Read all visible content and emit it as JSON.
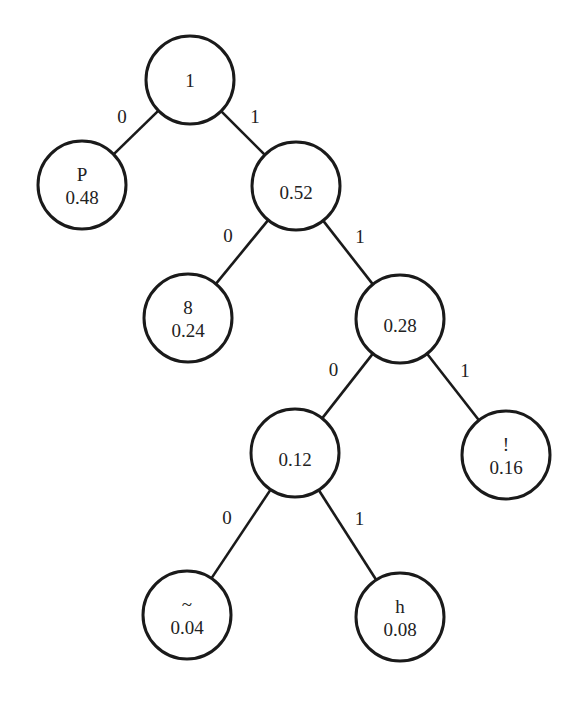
{
  "diagram": {
    "type": "huffman-tree",
    "nodes": [
      {
        "id": "root",
        "symbol": "",
        "prob": "1",
        "cx": 190,
        "cy": 80
      },
      {
        "id": "P",
        "symbol": "P",
        "prob": "0.48",
        "cx": 82,
        "cy": 185
      },
      {
        "id": "n052",
        "symbol": "",
        "prob": "0.52",
        "cx": 296,
        "cy": 186
      },
      {
        "id": "n8",
        "symbol": "8",
        "prob": "0.24",
        "cx": 188,
        "cy": 318
      },
      {
        "id": "n028",
        "symbol": "",
        "prob": "0.28",
        "cx": 400,
        "cy": 319
      },
      {
        "id": "n012",
        "symbol": "",
        "prob": "0.12",
        "cx": 295,
        "cy": 453
      },
      {
        "id": "bang",
        "symbol": "!",
        "prob": "0.16",
        "cx": 506,
        "cy": 455
      },
      {
        "id": "tilde",
        "symbol": "~",
        "prob": "0.04",
        "cx": 187,
        "cy": 615
      },
      {
        "id": "h",
        "symbol": "h",
        "prob": "0.08",
        "cx": 400,
        "cy": 617
      }
    ],
    "edges": [
      {
        "from": "root",
        "to": "P",
        "label": "0"
      },
      {
        "from": "root",
        "to": "n052",
        "label": "1"
      },
      {
        "from": "n052",
        "to": "n8",
        "label": "0"
      },
      {
        "from": "n052",
        "to": "n028",
        "label": "1"
      },
      {
        "from": "n028",
        "to": "n012",
        "label": "0"
      },
      {
        "from": "n028",
        "to": "bang",
        "label": "1"
      },
      {
        "from": "n012",
        "to": "tilde",
        "label": "0"
      },
      {
        "from": "n012",
        "to": "h",
        "label": "1"
      }
    ]
  }
}
